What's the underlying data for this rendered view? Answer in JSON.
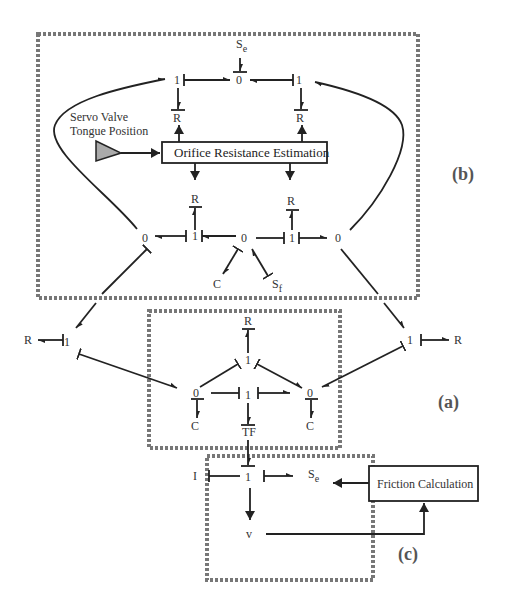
{
  "diagram": {
    "type": "bond-graph",
    "regions": [
      {
        "id": "b",
        "label": "(b)"
      },
      {
        "id": "a",
        "label": "(a)"
      },
      {
        "id": "c",
        "label": "(c)"
      }
    ],
    "blocks": {
      "orifice": "Orifice Resistance Estimation",
      "friction": "Friction Calculation",
      "servo_line1": "Servo Valve",
      "servo_line2": "Tongue Position"
    },
    "nodes": {
      "b_se": "S",
      "b_se_sub": "e",
      "b_top_1_left": "1",
      "b_top_0": "0",
      "b_top_1_right": "1",
      "b_R_top_left": "R",
      "b_R_top_right": "R",
      "b_R_mid_left": "R",
      "b_R_mid_right": "R",
      "b_0_left": "0",
      "b_1_left": "1",
      "b_0_center": "0",
      "b_1_right": "1",
      "b_0_right": "0",
      "b_C": "C",
      "b_sf": "S",
      "b_sf_sub": "f",
      "R_far_left": "R",
      "one_left": "1",
      "one_right": "1",
      "R_far_right": "R",
      "a_R": "R",
      "a_1_top": "1",
      "a_0_left": "0",
      "a_1_mid": "1",
      "a_0_right": "0",
      "a_C_left": "C",
      "a_TF": "TF",
      "a_C_right": "C",
      "c_I": "I",
      "c_1": "1",
      "c_se": "S",
      "c_se_sub": "e",
      "c_v": "v"
    }
  }
}
